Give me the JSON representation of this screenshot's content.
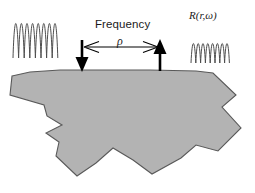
{
  "figure": {
    "background_color": "#ffffff",
    "width": 255,
    "height": 193
  },
  "labels": {
    "frequency": "Frequency",
    "separation_symbol": "ρ",
    "response_function": "R(r,ω)"
  },
  "colors": {
    "body_fill": "#b3b3b3",
    "body_stroke": "#595959",
    "ink": "#1a1a1a",
    "wave_stroke": "#4d4d4d"
  },
  "elements": {
    "transmitter_arrow": {
      "name": "down-arrow",
      "direction": "down",
      "x": 82,
      "y_top": 40,
      "y_bottom": 71
    },
    "receiver_arrow": {
      "name": "up-arrow",
      "direction": "up",
      "x": 160,
      "y_top": 39,
      "y_bottom": 71
    },
    "separation_arrow": {
      "name": "double-headed-horizontal-arrow",
      "x_left": 84,
      "x_right": 158,
      "y": 47
    },
    "incident_wave": {
      "name": "incident-waveform",
      "cycles": 4,
      "x": 13,
      "y": 10,
      "width": 46,
      "height": 48
    },
    "response_wave": {
      "name": "response-waveform",
      "cycles": 3.5,
      "x": 191,
      "y": 36,
      "width": 44,
      "height": 28
    },
    "subsurface_body": {
      "name": "subsurface-body-polygon",
      "top_edge_y": 71,
      "vertices": [
        [
          12,
          76
        ],
        [
          30,
          72
        ],
        [
          60,
          70
        ],
        [
          150,
          70
        ],
        [
          196,
          71
        ],
        [
          213,
          73
        ],
        [
          236,
          95
        ],
        [
          222,
          107
        ],
        [
          241,
          128
        ],
        [
          218,
          151
        ],
        [
          196,
          145
        ],
        [
          181,
          158
        ],
        [
          152,
          174
        ],
        [
          133,
          160
        ],
        [
          113,
          148
        ],
        [
          96,
          163
        ],
        [
          77,
          176
        ],
        [
          56,
          156
        ],
        [
          59,
          142
        ],
        [
          46,
          133
        ],
        [
          62,
          125
        ],
        [
          47,
          116
        ],
        [
          44,
          105
        ],
        [
          10,
          95
        ]
      ]
    }
  }
}
